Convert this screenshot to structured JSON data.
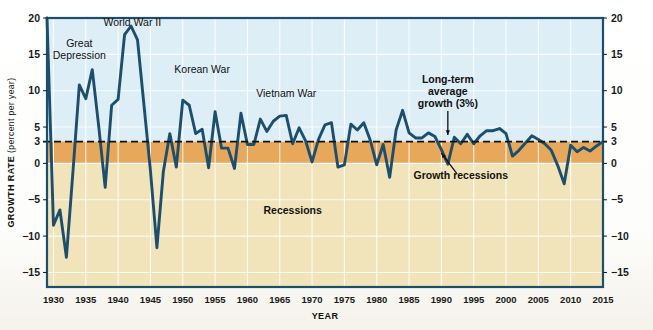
{
  "chart_data": {
    "type": "line",
    "title": "",
    "xlabel": "YEAR",
    "ylabel": "GROWTH RATE",
    "ylabel_sub": "(percent per year)",
    "xlim": [
      1929,
      2015
    ],
    "ylim": [
      -17,
      20
    ],
    "grid": true,
    "legend": "none",
    "xticks": [
      1930,
      1935,
      1940,
      1945,
      1950,
      1955,
      1960,
      1965,
      1970,
      1975,
      1980,
      1985,
      1990,
      1995,
      2000,
      2005,
      2010,
      2015
    ],
    "xtick_labels": [
      "1930",
      "1935",
      "1940",
      "1945",
      "1950",
      "1955",
      "1960",
      "1965",
      "1970",
      "1975",
      "1980",
      "1985",
      "1990",
      "1995",
      "2000",
      "2005",
      "2010",
      "2015"
    ],
    "yticks": [
      20,
      15,
      10,
      5,
      3,
      0,
      -5,
      -10,
      -15
    ],
    "ytick_labels": [
      "20",
      "15",
      "10",
      "5",
      "3",
      "0",
      "−5",
      "−10",
      "−15"
    ],
    "ytick_labels_right": [
      "20",
      "15",
      "10",
      "5",
      "3",
      "0",
      "−5",
      "−10",
      "−15"
    ],
    "series": [
      {
        "name": "Real GDP growth rate",
        "color": "#1c4f6e",
        "x": [
          1929,
          1930,
          1931,
          1932,
          1933,
          1934,
          1935,
          1936,
          1937,
          1938,
          1939,
          1940,
          1941,
          1942,
          1943,
          1944,
          1945,
          1946,
          1947,
          1948,
          1949,
          1950,
          1951,
          1952,
          1953,
          1954,
          1955,
          1956,
          1957,
          1958,
          1959,
          1960,
          1961,
          1962,
          1963,
          1964,
          1965,
          1966,
          1967,
          1968,
          1969,
          1970,
          1971,
          1972,
          1973,
          1974,
          1975,
          1976,
          1977,
          1978,
          1979,
          1980,
          1981,
          1982,
          1983,
          1984,
          1985,
          1986,
          1987,
          1988,
          1989,
          1990,
          1991,
          1992,
          1993,
          1994,
          1995,
          1996,
          1997,
          1998,
          1999,
          2000,
          2001,
          2002,
          2003,
          2004,
          2005,
          2006,
          2007,
          2008,
          2009,
          2010,
          2011,
          2012,
          2013,
          2014,
          2015
        ],
        "y": [
          20.0,
          -8.5,
          -6.4,
          -12.9,
          -1.3,
          10.8,
          8.9,
          12.9,
          5.1,
          -3.3,
          8.0,
          8.8,
          17.7,
          18.9,
          17.0,
          8.0,
          -1.0,
          -11.6,
          -1.1,
          4.1,
          -0.5,
          8.7,
          8.0,
          4.1,
          4.7,
          -0.6,
          7.1,
          2.1,
          2.1,
          -0.7,
          6.9,
          2.6,
          2.6,
          6.1,
          4.4,
          5.8,
          6.5,
          6.6,
          2.7,
          4.9,
          3.1,
          0.2,
          3.3,
          5.3,
          5.6,
          -0.5,
          -0.2,
          5.4,
          4.6,
          5.6,
          3.2,
          -0.2,
          2.6,
          -1.9,
          4.6,
          7.3,
          4.2,
          3.5,
          3.5,
          4.2,
          3.7,
          1.9,
          -0.1,
          3.6,
          2.7,
          4.0,
          2.7,
          3.8,
          4.5,
          4.5,
          4.8,
          4.1,
          1.0,
          1.8,
          2.8,
          3.8,
          3.3,
          2.7,
          1.8,
          -0.3,
          -2.8,
          2.5,
          1.6,
          2.2,
          1.7,
          2.4,
          3.0
        ]
      }
    ],
    "reference_line": {
      "label": "Long-term average growth (3%)",
      "value": 3,
      "style": "dashed",
      "color": "#111111"
    },
    "bands": [
      {
        "name": "above-average-growth",
        "from": 3,
        "to": 20,
        "color": "#deeef7"
      },
      {
        "name": "growth-recession-band",
        "from": 0,
        "to": 3,
        "color": "#e8a85c"
      },
      {
        "name": "recession-band",
        "from": -17,
        "to": 0,
        "color": "#f1e4ba"
      }
    ],
    "annotations": [
      {
        "id": "great-depression",
        "text": "Great\nDepression",
        "x": 1934.0,
        "y": 16.0,
        "bold": false
      },
      {
        "id": "world-war-ii",
        "text": "World War II",
        "x": 1942.2,
        "y": 18.9,
        "bold": false
      },
      {
        "id": "korean-war",
        "text": "Korean War",
        "x": 1953.0,
        "y": 12.4,
        "bold": false
      },
      {
        "id": "vietnam-war",
        "text": "Vietnam War",
        "x": 1966.0,
        "y": 9.2,
        "bold": false
      },
      {
        "id": "long-term-average-growth",
        "text": "Long-term\naverage\ngrowth (3%)",
        "x": 1991.0,
        "y": 11.0,
        "bold": true
      },
      {
        "id": "growth-recessions",
        "text": "Growth recessions",
        "x": 1993.0,
        "y": -2.1,
        "bold": true
      },
      {
        "id": "recessions",
        "text": "Recessions",
        "x": 1967.0,
        "y": -7.0,
        "bold": true
      }
    ],
    "colors": {
      "line": "#1c4f6e",
      "upper_background": "#deeef7",
      "growth_recession_band": "#e8a85c",
      "recession_band": "#f1e4ba",
      "gridline": "#ffffff",
      "plot_border": "#1c4f6e",
      "dashed_reference": "#111111",
      "page_background": "#ffffff"
    }
  }
}
